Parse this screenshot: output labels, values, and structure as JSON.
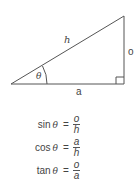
{
  "diagram": {
    "type": "right-triangle",
    "labels": {
      "hypotenuse": "h",
      "opposite": "o",
      "adjacent": "a",
      "angle": "θ"
    },
    "colors": {
      "line": "#555555",
      "text": "#444444"
    }
  },
  "formulas": [
    {
      "fn": "sin",
      "var": "θ",
      "eq": "=",
      "numerator": "o",
      "denominator": "h"
    },
    {
      "fn": "cos",
      "var": "θ",
      "eq": "=",
      "numerator": "a",
      "denominator": "h"
    },
    {
      "fn": "tan",
      "var": "θ",
      "eq": "=",
      "numerator": "o",
      "denominator": "a"
    }
  ]
}
